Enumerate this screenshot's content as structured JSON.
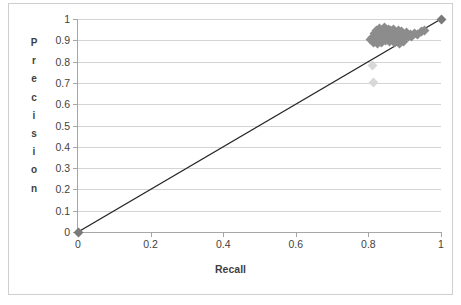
{
  "chart_data": {
    "type": "scatter",
    "title": "",
    "xlabel": "Recall",
    "ylabel": "Precision",
    "ylabel_letters": [
      "P",
      "r",
      "e",
      "c",
      "i",
      "s",
      "i",
      "o",
      "n"
    ],
    "xlim": [
      0,
      1
    ],
    "ylim": [
      0,
      1
    ],
    "xticks": [
      0,
      0.2,
      0.4,
      0.6,
      0.8,
      1
    ],
    "xtick_labels": [
      "0",
      "0.2",
      "0.4",
      "0.6",
      "0.8",
      "1"
    ],
    "yticks": [
      0,
      0.1,
      0.2,
      0.3,
      0.4,
      0.5,
      0.6,
      0.7,
      0.8,
      0.9,
      1
    ],
    "ytick_labels": [
      "0",
      "0.1",
      "0.2",
      "0.3",
      "0.4",
      "0.5",
      "0.6",
      "0.7",
      "0.8",
      "0.9",
      "1"
    ],
    "grid": "horizontal",
    "legend": "none",
    "marker_color": "#8c8c8c",
    "trendline_color": "#262626",
    "gridline_color": "#d4d4d4",
    "axis_color": "#a6a6a6",
    "background": "#ffffff",
    "trendline": {
      "x": [
        0,
        1
      ],
      "y": [
        0,
        1
      ]
    },
    "points": [
      {
        "x": 0.0,
        "y": 0.0,
        "style": "dark"
      },
      {
        "x": 0.815,
        "y": 0.7,
        "style": "faint"
      },
      {
        "x": 0.812,
        "y": 0.78,
        "style": "faint"
      },
      {
        "x": 0.805,
        "y": 0.905,
        "style": "normal"
      },
      {
        "x": 0.812,
        "y": 0.915,
        "style": "normal"
      },
      {
        "x": 0.815,
        "y": 0.89,
        "style": "normal"
      },
      {
        "x": 0.818,
        "y": 0.93,
        "style": "normal"
      },
      {
        "x": 0.82,
        "y": 0.9,
        "style": "normal"
      },
      {
        "x": 0.822,
        "y": 0.945,
        "style": "normal"
      },
      {
        "x": 0.824,
        "y": 0.918,
        "style": "normal"
      },
      {
        "x": 0.826,
        "y": 0.885,
        "style": "normal"
      },
      {
        "x": 0.828,
        "y": 0.935,
        "style": "normal"
      },
      {
        "x": 0.83,
        "y": 0.955,
        "style": "normal"
      },
      {
        "x": 0.832,
        "y": 0.908,
        "style": "normal"
      },
      {
        "x": 0.834,
        "y": 0.925,
        "style": "normal"
      },
      {
        "x": 0.836,
        "y": 0.89,
        "style": "normal"
      },
      {
        "x": 0.838,
        "y": 0.948,
        "style": "normal"
      },
      {
        "x": 0.84,
        "y": 0.912,
        "style": "normal"
      },
      {
        "x": 0.842,
        "y": 0.932,
        "style": "normal"
      },
      {
        "x": 0.844,
        "y": 0.958,
        "style": "normal"
      },
      {
        "x": 0.846,
        "y": 0.898,
        "style": "normal"
      },
      {
        "x": 0.848,
        "y": 0.922,
        "style": "normal"
      },
      {
        "x": 0.85,
        "y": 0.94,
        "style": "normal"
      },
      {
        "x": 0.852,
        "y": 0.905,
        "style": "normal"
      },
      {
        "x": 0.854,
        "y": 0.952,
        "style": "normal"
      },
      {
        "x": 0.856,
        "y": 0.928,
        "style": "normal"
      },
      {
        "x": 0.858,
        "y": 0.895,
        "style": "normal"
      },
      {
        "x": 0.86,
        "y": 0.944,
        "style": "normal"
      },
      {
        "x": 0.862,
        "y": 0.916,
        "style": "normal"
      },
      {
        "x": 0.864,
        "y": 0.935,
        "style": "normal"
      },
      {
        "x": 0.866,
        "y": 0.902,
        "style": "normal"
      },
      {
        "x": 0.868,
        "y": 0.95,
        "style": "normal"
      },
      {
        "x": 0.87,
        "y": 0.924,
        "style": "normal"
      },
      {
        "x": 0.872,
        "y": 0.89,
        "style": "normal"
      },
      {
        "x": 0.874,
        "y": 0.938,
        "style": "normal"
      },
      {
        "x": 0.876,
        "y": 0.912,
        "style": "normal"
      },
      {
        "x": 0.878,
        "y": 0.93,
        "style": "normal"
      },
      {
        "x": 0.88,
        "y": 0.9,
        "style": "normal"
      },
      {
        "x": 0.882,
        "y": 0.945,
        "style": "normal"
      },
      {
        "x": 0.884,
        "y": 0.92,
        "style": "normal"
      },
      {
        "x": 0.886,
        "y": 0.885,
        "style": "normal"
      },
      {
        "x": 0.888,
        "y": 0.932,
        "style": "normal"
      },
      {
        "x": 0.89,
        "y": 0.908,
        "style": "normal"
      },
      {
        "x": 0.892,
        "y": 0.94,
        "style": "normal"
      },
      {
        "x": 0.894,
        "y": 0.918,
        "style": "normal"
      },
      {
        "x": 0.896,
        "y": 0.895,
        "style": "normal"
      },
      {
        "x": 0.898,
        "y": 0.928,
        "style": "normal"
      },
      {
        "x": 0.9,
        "y": 0.912,
        "style": "normal"
      },
      {
        "x": 0.905,
        "y": 0.935,
        "style": "normal"
      },
      {
        "x": 0.91,
        "y": 0.92,
        "style": "normal"
      },
      {
        "x": 0.915,
        "y": 0.928,
        "style": "normal"
      },
      {
        "x": 0.92,
        "y": 0.918,
        "style": "normal"
      },
      {
        "x": 0.928,
        "y": 0.93,
        "style": "normal"
      },
      {
        "x": 0.935,
        "y": 0.925,
        "style": "normal"
      },
      {
        "x": 0.945,
        "y": 0.94,
        "style": "normal"
      },
      {
        "x": 0.955,
        "y": 0.948,
        "style": "normal"
      },
      {
        "x": 1.0,
        "y": 1.0,
        "style": "dark"
      }
    ]
  }
}
